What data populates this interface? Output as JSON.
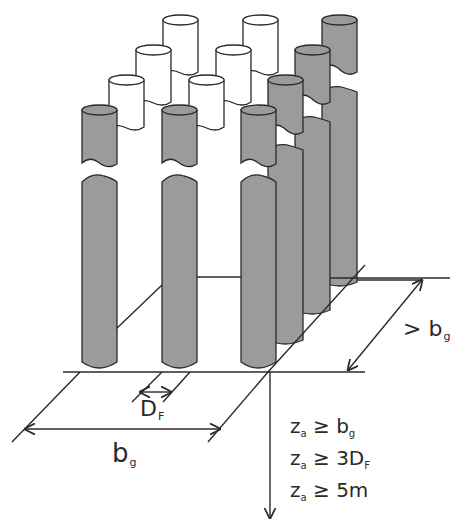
{
  "diagram": {
    "colors": {
      "pile_fill_front": "#9b9b9b",
      "pile_fill_white": "#ffffff",
      "stroke": "#2a2a2a",
      "background": "#ffffff"
    },
    "labels": {
      "group_width": {
        "main": "b",
        "sub": "g"
      },
      "pile_diameter": {
        "main": "D",
        "sub": "F"
      },
      "depth_extent": {
        "prefix": "> b",
        "sub": "g"
      }
    },
    "conditions": [
      {
        "var": "z",
        "sub": "a",
        "op": "≥",
        "value": "b",
        "value_sub": "g"
      },
      {
        "var": "z",
        "sub": "a",
        "op": "≥",
        "value": "3D",
        "value_sub": "F"
      },
      {
        "var": "z",
        "sub": "a",
        "op": "≥",
        "value": "5m",
        "value_sub": ""
      }
    ],
    "pile_layout": {
      "columns": 3,
      "rows": 4,
      "front_row_color": "gray",
      "right_column_color": "gray",
      "other_piles_color": "white"
    }
  }
}
